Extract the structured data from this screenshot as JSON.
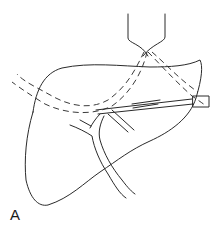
{
  "figure": {
    "panel_label": "A",
    "elements": [
      {
        "name": "liver-outline",
        "style": "solid"
      },
      {
        "name": "ultrasound-probe",
        "style": "solid"
      },
      {
        "name": "ultrasound-beam",
        "style": "dashed"
      },
      {
        "name": "needle",
        "style": "solid"
      },
      {
        "name": "bile-ducts",
        "style": "solid"
      }
    ],
    "colors": {
      "stroke": "#2a2a2a",
      "background": "#ffffff"
    }
  }
}
